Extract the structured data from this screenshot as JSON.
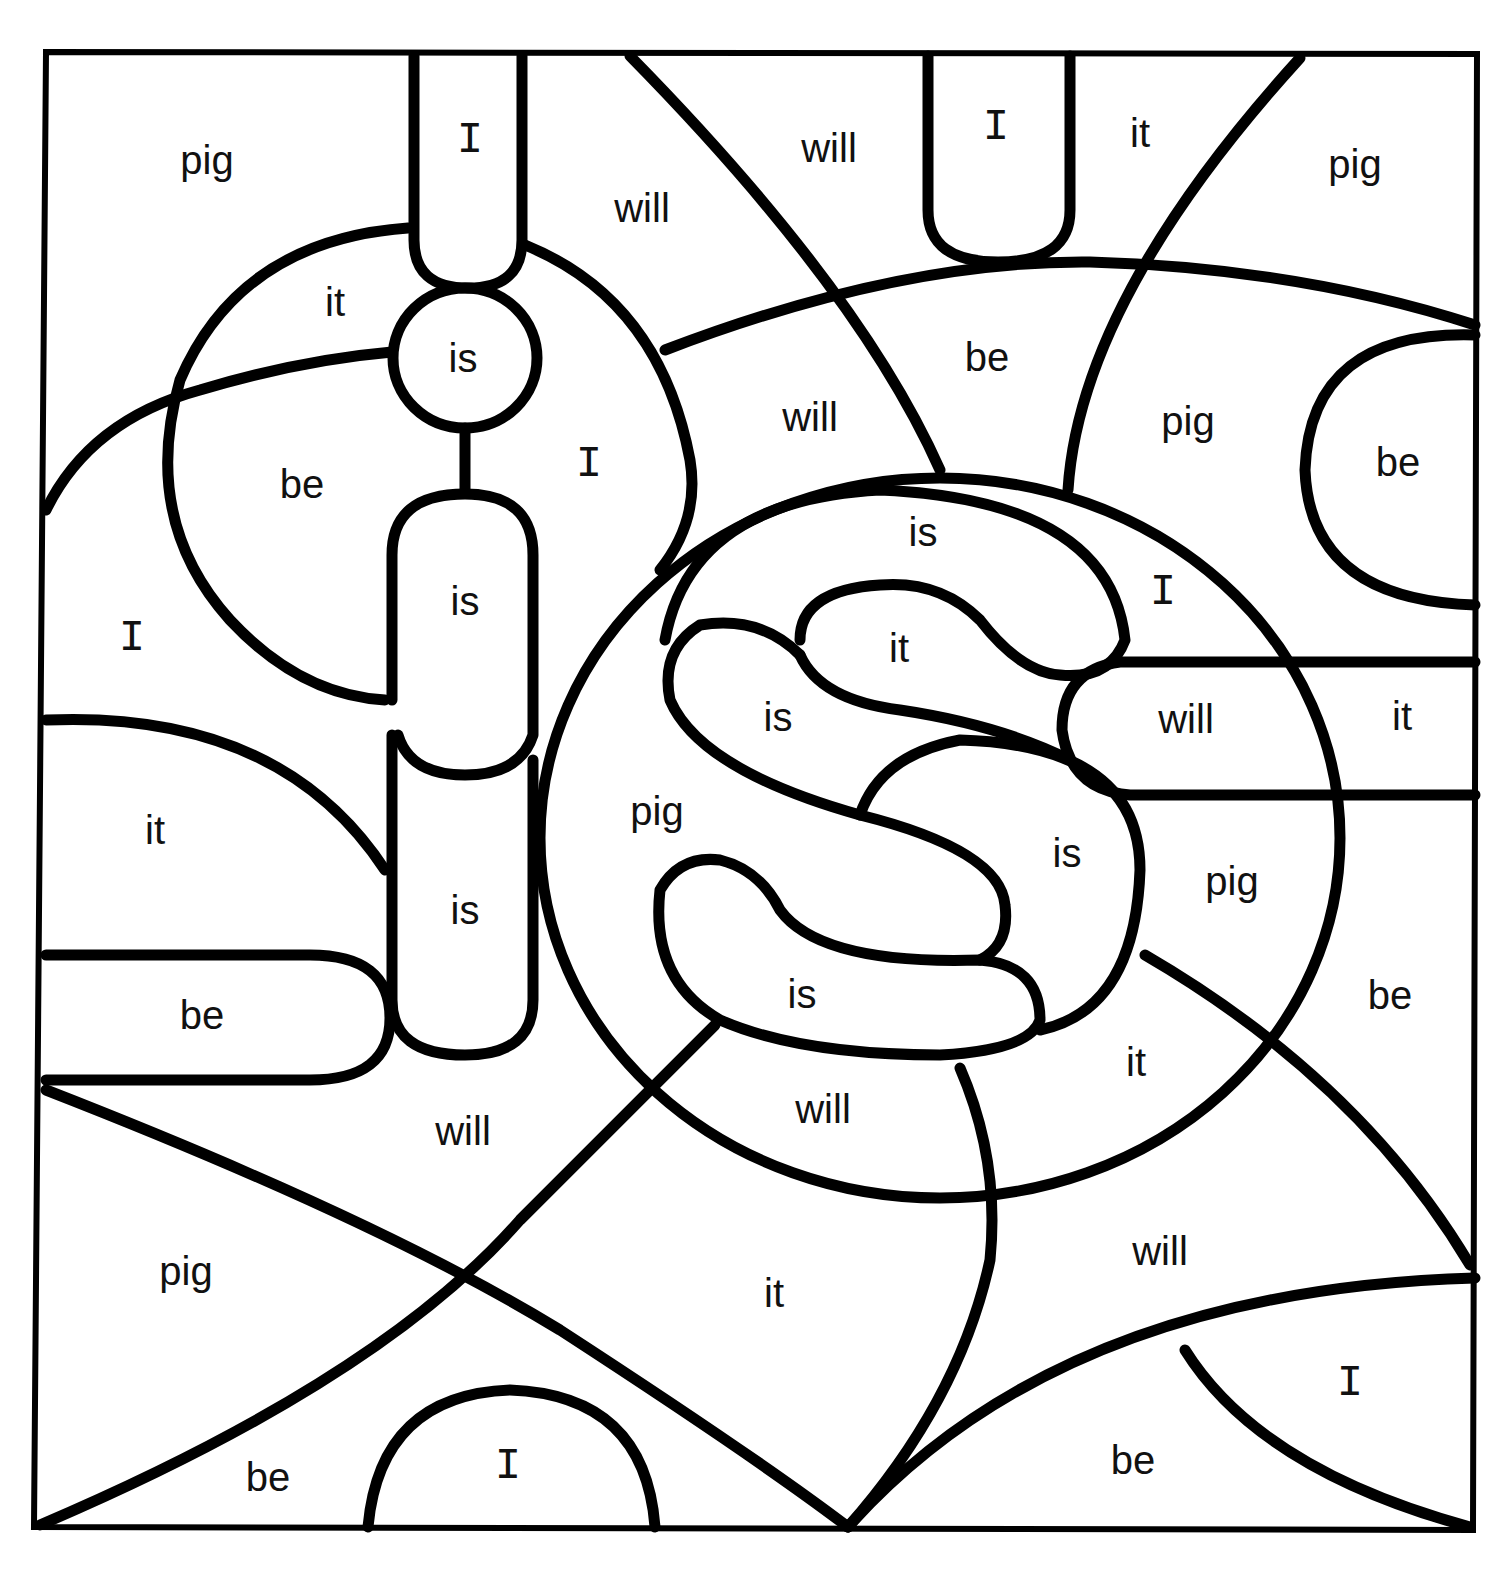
{
  "worksheet": {
    "title": "",
    "words": [
      {
        "text": "pig",
        "x": 207,
        "y": 160
      },
      {
        "text": "I",
        "x": 470,
        "y": 140,
        "mono": true
      },
      {
        "text": "will",
        "x": 642,
        "y": 208
      },
      {
        "text": "will",
        "x": 829,
        "y": 148
      },
      {
        "text": "I",
        "x": 996,
        "y": 127,
        "mono": true
      },
      {
        "text": "it",
        "x": 1140,
        "y": 133
      },
      {
        "text": "pig",
        "x": 1355,
        "y": 164
      },
      {
        "text": "it",
        "x": 335,
        "y": 302
      },
      {
        "text": "is",
        "x": 463,
        "y": 358
      },
      {
        "text": "be",
        "x": 302,
        "y": 484
      },
      {
        "text": "I",
        "x": 589,
        "y": 464,
        "mono": true
      },
      {
        "text": "will",
        "x": 810,
        "y": 417
      },
      {
        "text": "be",
        "x": 987,
        "y": 357
      },
      {
        "text": "pig",
        "x": 1188,
        "y": 421
      },
      {
        "text": "be",
        "x": 1398,
        "y": 462
      },
      {
        "text": "is",
        "x": 923,
        "y": 532
      },
      {
        "text": "I",
        "x": 1163,
        "y": 592,
        "mono": true
      },
      {
        "text": "is",
        "x": 465,
        "y": 601
      },
      {
        "text": "I",
        "x": 132,
        "y": 638,
        "mono": true
      },
      {
        "text": "it",
        "x": 899,
        "y": 648
      },
      {
        "text": "is",
        "x": 778,
        "y": 717
      },
      {
        "text": "will",
        "x": 1186,
        "y": 719
      },
      {
        "text": "it",
        "x": 1402,
        "y": 716
      },
      {
        "text": "it",
        "x": 155,
        "y": 830
      },
      {
        "text": "pig",
        "x": 657,
        "y": 811
      },
      {
        "text": "is",
        "x": 1067,
        "y": 853
      },
      {
        "text": "pig",
        "x": 1232,
        "y": 881
      },
      {
        "text": "is",
        "x": 465,
        "y": 910
      },
      {
        "text": "be",
        "x": 202,
        "y": 1015
      },
      {
        "text": "is",
        "x": 802,
        "y": 994
      },
      {
        "text": "be",
        "x": 1390,
        "y": 995
      },
      {
        "text": "it",
        "x": 1136,
        "y": 1062
      },
      {
        "text": "will",
        "x": 463,
        "y": 1131
      },
      {
        "text": "will",
        "x": 823,
        "y": 1109
      },
      {
        "text": "will",
        "x": 1160,
        "y": 1251
      },
      {
        "text": "pig",
        "x": 186,
        "y": 1271
      },
      {
        "text": "it",
        "x": 774,
        "y": 1293
      },
      {
        "text": "I",
        "x": 1350,
        "y": 1383,
        "mono": true
      },
      {
        "text": "be",
        "x": 268,
        "y": 1477
      },
      {
        "text": "I",
        "x": 508,
        "y": 1466,
        "mono": true
      },
      {
        "text": "be",
        "x": 1133,
        "y": 1460
      }
    ]
  }
}
